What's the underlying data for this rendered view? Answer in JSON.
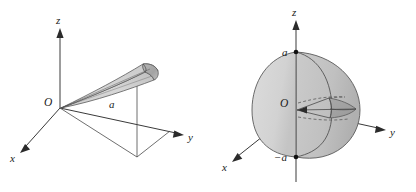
{
  "figure": {
    "panels": [
      {
        "id": "left",
        "name": "cone-wedge-diagram",
        "description": "A thin cone/wedge solid emanating from the origin toward the y direction above the xy-plane, with its projection drawn in the xy-plane",
        "axes": {
          "z_label": "z",
          "x_label": "x",
          "y_label": "y"
        },
        "origin_label": "O",
        "dimension_label": "a",
        "colors": {
          "line": "#4a4a4a",
          "axis": "#3a3a3a",
          "fill_light": "#d8d8d8",
          "fill_mid": "#c3c3c3",
          "fill_dark": "#9f9f9f",
          "label": "#1a1a1a"
        }
      },
      {
        "id": "right",
        "name": "hemisphere-wedge-diagram",
        "description": "A half-ball of radius a centered at the origin with a wedge-shaped notch removed near the equator, flat face lying in the xz-plane",
        "axes": {
          "z_label": "z",
          "x_label": "x",
          "y_label": "y"
        },
        "origin_label": "O",
        "top_point_label": "a",
        "bottom_point_label": "−a",
        "colors": {
          "line": "#4a4a4a",
          "axis": "#3a3a3a",
          "fill_light": "#dcdcdc",
          "fill_mid": "#c8c8c8",
          "fill_dark": "#a6a6a6",
          "label": "#1a1a1a"
        }
      }
    ]
  }
}
